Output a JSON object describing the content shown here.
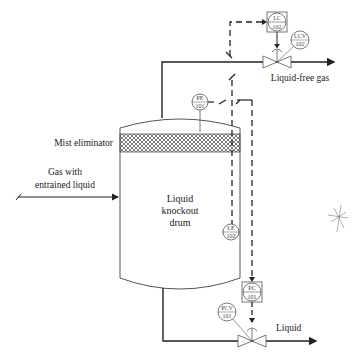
{
  "diagram": {
    "type": "process-flow / P&ID",
    "labels": {
      "mist_eliminator": "Mist eliminator",
      "inlet_line1": "Gas with",
      "inlet_line2": "entrained liquid",
      "drum_line1": "Liquid",
      "drum_line2": "knockout",
      "drum_line3": "drum",
      "gas_outlet": "Liquid-free gas",
      "liquid_outlet": "Liquid"
    },
    "instruments": {
      "lc": {
        "top": "LC",
        "bottom": "102"
      },
      "lcv": {
        "top": "LCV",
        "bottom": "102"
      },
      "pe": {
        "top": "PE",
        "bottom": "101"
      },
      "le": {
        "top": "LE",
        "bottom": "102"
      },
      "pc": {
        "top": "PC",
        "bottom": "101"
      },
      "pcv": {
        "top": "PCV",
        "bottom": "101"
      }
    },
    "colors": {
      "line": "#222222",
      "instrument": "#555555",
      "mesh": "#444444"
    }
  }
}
